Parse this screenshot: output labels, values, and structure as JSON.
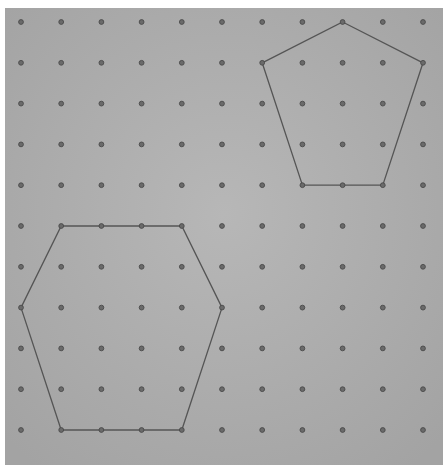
{
  "board": {
    "type": "geoboard",
    "background_color": "#a9a9a9",
    "peg_color": "#4a4a4a",
    "line_color": "#555555",
    "rows": 11,
    "cols": 11,
    "origin_x": 21,
    "origin_y": 22,
    "spacing_x": 40.2,
    "spacing_y": 40.8
  },
  "shapes": [
    {
      "name": "pentagon",
      "vertices": [
        [
          8,
          0
        ],
        [
          10,
          1
        ],
        [
          9,
          4
        ],
        [
          7,
          4
        ],
        [
          6,
          1
        ]
      ]
    },
    {
      "name": "hexagon",
      "vertices": [
        [
          1,
          5
        ],
        [
          4,
          5
        ],
        [
          5,
          7
        ],
        [
          4,
          10
        ],
        [
          1,
          10
        ],
        [
          0,
          7
        ]
      ]
    }
  ]
}
